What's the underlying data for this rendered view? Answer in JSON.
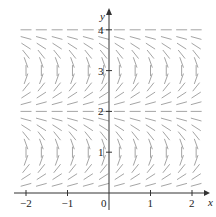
{
  "chart_data": {
    "type": "slope_field",
    "title": "",
    "xlabel": "x",
    "ylabel": "y",
    "xlim": [
      -2.1,
      2.2
    ],
    "ylim": [
      -0.1,
      4.2
    ],
    "x_ticks": [
      -2,
      -1,
      0,
      1,
      2
    ],
    "x_tick_labels": [
      "-2",
      "-1",
      "0",
      "1",
      "2"
    ],
    "y_ticks": [
      1,
      2,
      3,
      4
    ],
    "y_tick_labels": [
      "1",
      "2",
      "3",
      "4"
    ],
    "grid": false,
    "legend": null,
    "field": {
      "x_samples": [
        -2.0,
        -1.63,
        -1.25,
        -0.88,
        -0.5,
        -0.13,
        0.25,
        0.63,
        1.0,
        1.38,
        1.75,
        2.1
      ],
      "y_step": 0.2,
      "y_range": [
        0.2,
        4.0
      ],
      "slope_depends_on": "y only",
      "horizontal_at_y": [
        0,
        2,
        4
      ],
      "vertical_near_y": [
        1,
        3
      ],
      "positive_slope_intervals": [
        [
          0,
          1
        ],
        [
          2,
          3
        ]
      ],
      "negative_slope_intervals": [
        [
          1,
          2
        ],
        [
          3,
          4
        ]
      ]
    },
    "segment_color": "#9a9a9a",
    "axis_color": "#333333"
  }
}
